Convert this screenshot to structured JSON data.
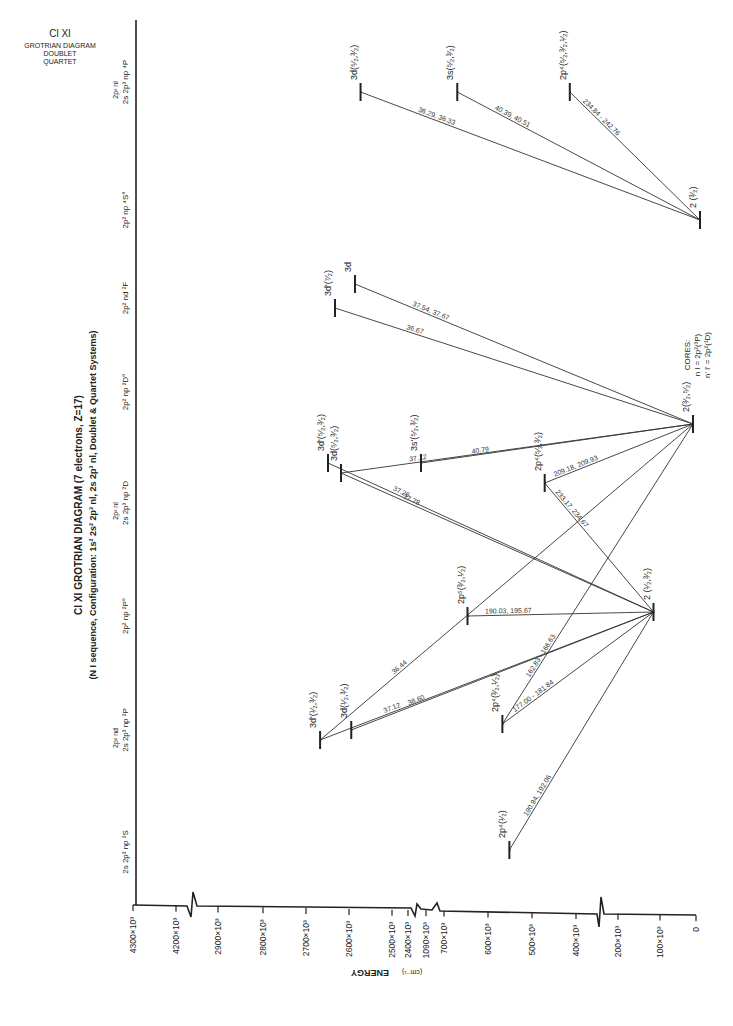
{
  "chart_data": {
    "type": "diagram",
    "title": "Cl XI  GROTRIAN DIAGRAM (7 electrons, Z=17)",
    "subtitle": "(N I sequence, Configuration: 1s² 2s² 2p³ nl, 2s 2p³ nl, Doublet & Quartet Systems)",
    "corner_label": [
      "Cl XI",
      "GROTRIAN DIAGRAM",
      "DOUBLET",
      "QUARTET"
    ],
    "cores_note": [
      "CORES:",
      "n l = 2p²(³P)",
      "n' l' = 2p²(¹D)"
    ],
    "energy_axis": {
      "label": "ENERGY",
      "unit": "(cm⁻¹)",
      "ticks": [
        "4300×10³",
        "4200×10³",
        "2900×10³",
        "2800×10³",
        "2700×10³",
        "2600×10³",
        "2500×10³",
        "2400×10³",
        "1090×10³",
        "700×10³",
        "600×10³",
        "500×10³",
        "400×10³",
        "200×10³",
        "100×10³",
        "0"
      ],
      "breaks": [
        "4200-2900",
        "2400-1090",
        "1090-700",
        "400-200"
      ]
    },
    "columns": [
      {
        "id": "4P",
        "label_top": "2p² nl",
        "label": "2s 2p³ np ⁴P"
      },
      {
        "id": "4So",
        "label_top": "",
        "label": "2p² np ⁴S°"
      },
      {
        "id": "2F",
        "label_top": "",
        "label": "2p² nd ²F"
      },
      {
        "id": "2Do",
        "label_top": "",
        "label": "2p² np ²D°"
      },
      {
        "id": "2D",
        "label_top": "2p² nl",
        "label": "2s 2p³ np ²D"
      },
      {
        "id": "2Po",
        "label_top": "",
        "label": "2p² np ²P°"
      },
      {
        "id": "2P",
        "label_top": "2p² nd",
        "label": "2s 2p³ np ²P"
      },
      {
        "id": "2S",
        "label_top": "",
        "label": "2s 2p³ np ²S"
      }
    ],
    "levels": [
      {
        "id": "q3d",
        "col": "4P",
        "label": "3d(⁵⁄₂,³⁄₂)",
        "pos": 0.27
      },
      {
        "id": "q3s",
        "col": "4P",
        "label": "3s(⁵⁄₂,³⁄₂)",
        "pos": 0.478
      },
      {
        "id": "q2p4",
        "col": "4P",
        "label": "2p⁴(⁵⁄₂,³⁄₂,¹⁄₂)",
        "pos": 0.72
      },
      {
        "id": "q2",
        "col": "4So",
        "label": "2  (³⁄₂)",
        "pos": 1.0
      },
      {
        "id": "f3dp",
        "col": "2F",
        "label": "3d'(⁷⁄₂)",
        "pos": 0.215
      },
      {
        "id": "f3d",
        "col": "2F",
        "label": "3d",
        "pos": 0.258
      },
      {
        "id": "do2",
        "col": "2Do",
        "label": "2(³⁄₂,⁵⁄₂)",
        "pos": 0.985
      },
      {
        "id": "d3dp",
        "col": "2D",
        "label": "3d'(⁵⁄₂,³⁄₂)",
        "pos": 0.2
      },
      {
        "id": "d3d",
        "col": "2D",
        "label": "3d(⁵⁄₂,³⁄₂)",
        "pos": 0.228
      },
      {
        "id": "d3s",
        "col": "2D",
        "label": "3s'(⁵⁄₂,³⁄₂)",
        "pos": 0.4
      },
      {
        "id": "d2p4",
        "col": "2D",
        "label": "2p⁴(⁵⁄₂,³⁄₂)",
        "pos": 0.666
      },
      {
        "id": "po2",
        "col": "2Po",
        "label": "2  (¹⁄₂,³⁄₂)",
        "pos": 0.9
      },
      {
        "id": "po2p5",
        "col": "2Po",
        "label": "2p⁵(³⁄₂,¹⁄₂)",
        "pos": 0.5
      },
      {
        "id": "p3dp",
        "col": "2P",
        "label": "3d'(¹⁄₂,³⁄₂)",
        "pos": 0.183
      },
      {
        "id": "p3d",
        "col": "2P",
        "label": "3d(¹⁄₂,³⁄₂)",
        "pos": 0.25
      },
      {
        "id": "p2p4",
        "col": "2P",
        "label": "2p⁴(³⁄₂,¹⁄₂)",
        "pos": 0.575
      },
      {
        "id": "s2p4",
        "col": "2S",
        "label": "2p⁴(¹⁄₂)",
        "pos": 0.59
      }
    ],
    "transitions": [
      {
        "from": "q2",
        "to": "q3d",
        "wavelength": "36.29, 36.33"
      },
      {
        "from": "q2",
        "to": "q3s",
        "wavelength": "40.39, 40.51"
      },
      {
        "from": "q2",
        "to": "q2p4",
        "wavelength": "234.84 - 242.76"
      },
      {
        "from": "do2",
        "to": "f3dp",
        "wavelength": "36.67"
      },
      {
        "from": "do2",
        "to": "f3d",
        "wavelength": "37.54, 37.67"
      },
      {
        "from": "do2",
        "to": "d3d",
        "wavelength": "37.12"
      },
      {
        "from": "do2",
        "to": "d3s",
        "wavelength": "40.79"
      },
      {
        "from": "do2",
        "to": "d2p4",
        "wavelength": "209.18, 209.93"
      },
      {
        "from": "do2",
        "to": "p3dp",
        "wavelength": "36.44"
      },
      {
        "from": "do2",
        "to": "p2p4",
        "wavelength": "162.83 - 166.63"
      },
      {
        "from": "po2",
        "to": "d3d",
        "wavelength": "37.78"
      },
      {
        "from": "po2",
        "to": "d3dp",
        "wavelength": "37.26"
      },
      {
        "from": "po2",
        "to": "d2p4",
        "wavelength": "233.17, 234.67"
      },
      {
        "from": "po2",
        "to": "po2p5",
        "wavelength": "190.03, 195.67"
      },
      {
        "from": "po2",
        "to": "p3dp",
        "wavelength": "37.12"
      },
      {
        "from": "po2",
        "to": "p3d",
        "wavelength": "38.60"
      },
      {
        "from": "po2",
        "to": "p2p4",
        "wavelength": "177.00 - 181.84"
      },
      {
        "from": "po2",
        "to": "s2p4",
        "wavelength": "190.94, 192.06"
      }
    ]
  }
}
